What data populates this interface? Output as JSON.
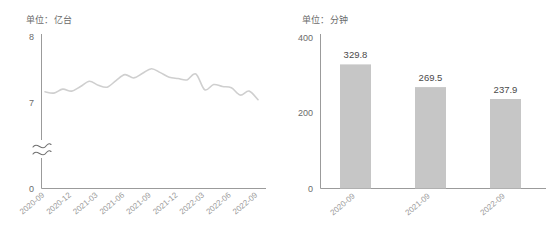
{
  "page": {
    "background_color": "#ffffff",
    "text_color": "#595959"
  },
  "line_panel": {
    "unit_label": "单位：亿台",
    "axis": {
      "y_ticks": [
        "8",
        "7",
        "0"
      ],
      "y_tick_values": [
        8,
        7,
        0
      ],
      "y_axis_break": true,
      "break_icon": "axis-break-wave",
      "line_color": "#cfcfcf",
      "axis_color": "#9b9b9b"
    }
  },
  "bar_panel": {
    "unit_label": "单位：分钟",
    "axis": {
      "y_ticks": [
        "400",
        "200",
        "0"
      ],
      "y_tick_values": [
        400,
        200,
        0
      ],
      "bar_color": "#c6c6c6",
      "axis_color": "#9b9b9b"
    }
  },
  "chart_data": [
    {
      "type": "line",
      "title": "",
      "subtitle": "",
      "xlabel": "",
      "ylabel": "单位：亿台",
      "ylim": [
        7,
        8
      ],
      "y_ticks": [
        7,
        8
      ],
      "y_axis_break": true,
      "grid": false,
      "legend": "none",
      "tick_labels": [
        "2020-09",
        "2020-12",
        "2021-03",
        "2021-06",
        "2021-09",
        "2021-12",
        "2022-03",
        "2022-06",
        "2022-09"
      ],
      "x": [
        "2020-09",
        "2020-10",
        "2020-11",
        "2020-12",
        "2021-01",
        "2021-02",
        "2021-03",
        "2021-04",
        "2021-05",
        "2021-06",
        "2021-07",
        "2021-08",
        "2021-09",
        "2021-10",
        "2021-11",
        "2021-12",
        "2022-01",
        "2022-02",
        "2022-03",
        "2022-04",
        "2022-05",
        "2022-06",
        "2022-07",
        "2022-08",
        "2022-09"
      ],
      "values": [
        7.17,
        7.15,
        7.21,
        7.18,
        7.25,
        7.33,
        7.27,
        7.24,
        7.34,
        7.43,
        7.38,
        7.45,
        7.52,
        7.46,
        7.39,
        7.37,
        7.35,
        7.44,
        7.2,
        7.28,
        7.25,
        7.23,
        7.12,
        7.18,
        7.05
      ],
      "series": [
        {
          "name": "移动电话用户数",
          "color": "#cfcfcf",
          "values": [
            7.17,
            7.15,
            7.21,
            7.18,
            7.25,
            7.33,
            7.27,
            7.24,
            7.34,
            7.43,
            7.38,
            7.45,
            7.52,
            7.46,
            7.39,
            7.37,
            7.35,
            7.44,
            7.2,
            7.28,
            7.25,
            7.23,
            7.12,
            7.18,
            7.05
          ]
        }
      ]
    },
    {
      "type": "bar",
      "title": "",
      "subtitle": "",
      "xlabel": "",
      "ylabel": "单位：分钟",
      "ylim": [
        0,
        400
      ],
      "y_ticks": [
        0,
        200,
        400
      ],
      "grid": false,
      "legend": "none",
      "categories": [
        "2020-09",
        "2021-09",
        "2022-09"
      ],
      "values": [
        329.8,
        269.5,
        237.9
      ],
      "data_labels": [
        "329.8",
        "269.5",
        "237.9"
      ],
      "bar_color": "#c6c6c6"
    }
  ]
}
